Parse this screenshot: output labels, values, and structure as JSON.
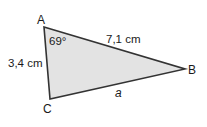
{
  "diagram": {
    "type": "triangle",
    "fill_color": "#e3e3e3",
    "stroke_color": "#333333",
    "vertices": {
      "A": {
        "label": "A",
        "x": 44,
        "y": 27
      },
      "B": {
        "label": "B",
        "x": 185,
        "y": 69
      },
      "C": {
        "label": "C",
        "x": 50,
        "y": 99
      }
    },
    "sides": {
      "AB": {
        "label": "7,1 cm"
      },
      "AC": {
        "label": "3,4 cm"
      },
      "BC": {
        "label": "a"
      }
    },
    "angles": {
      "A": {
        "label": "69°"
      }
    }
  }
}
